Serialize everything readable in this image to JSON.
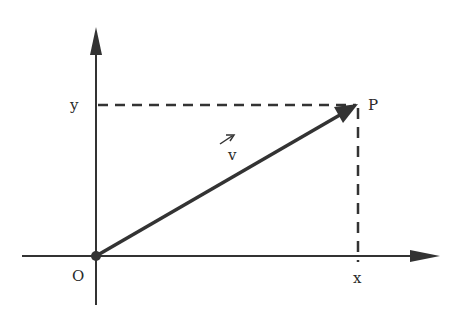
{
  "diagram": {
    "title": "",
    "labels": {
      "y_axis_mark": "y",
      "x_axis_mark": "x",
      "origin": "O",
      "point": "P",
      "vector": "v"
    },
    "colors": {
      "stroke": "#333333",
      "background": "#ffffff"
    },
    "elements": [
      {
        "type": "axis",
        "name": "x-axis",
        "from": [
          0,
          256
        ],
        "to": [
          438,
          256
        ]
      },
      {
        "type": "axis",
        "name": "y-axis",
        "from": [
          96,
          305
        ],
        "to": [
          96,
          28
        ]
      },
      {
        "type": "vector",
        "name": "v",
        "from": "O",
        "to": "P"
      },
      {
        "type": "dashed-line",
        "name": "projection-to-y",
        "from": "P",
        "to": "y"
      },
      {
        "type": "dashed-line",
        "name": "projection-to-x",
        "from": "P",
        "to": "x"
      }
    ]
  }
}
